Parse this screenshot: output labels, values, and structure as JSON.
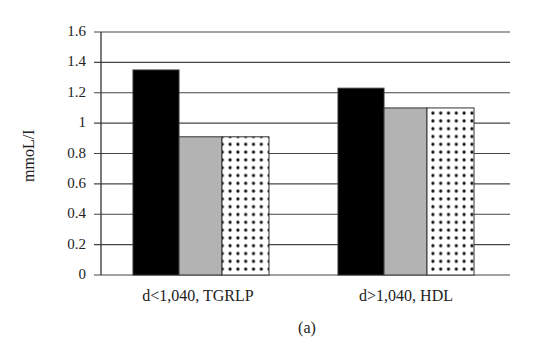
{
  "chart_data": {
    "type": "bar",
    "title": "",
    "caption": "(a)",
    "xlabel": "",
    "ylabel": "mmoL/I",
    "ylim": [
      0,
      1.6
    ],
    "yticks": [
      "0",
      "0.2",
      "0.4",
      "0.6",
      "0.8",
      "1",
      "1.2",
      "1.4",
      "1.6"
    ],
    "grid": true,
    "legend": null,
    "categories": [
      "d<1,040, TGRLP",
      "d>1,040, HDL"
    ],
    "series": [
      {
        "name": "series-1",
        "fill": "solid-black",
        "color": "#000000",
        "values": [
          1.35,
          1.23
        ]
      },
      {
        "name": "series-2",
        "fill": "solid-gray",
        "color": "#b3b3b3",
        "values": [
          0.91,
          1.1
        ]
      },
      {
        "name": "series-3",
        "fill": "dotted",
        "color": "#ffffff",
        "values": [
          0.91,
          1.1
        ]
      }
    ]
  }
}
